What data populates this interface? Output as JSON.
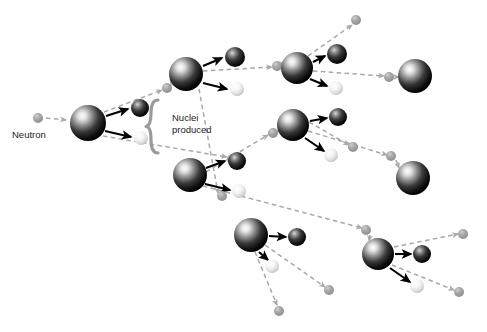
{
  "diagram": {
    "background_color": "#ffffff",
    "labels": {
      "neutron": "Neutron",
      "nuclei_produced_line1": "Nuclei",
      "nuclei_produced_line2": "produced"
    },
    "colors": {
      "neutron": "#9e9e9e",
      "neutron_arrow": "#a8a8a8",
      "nucleus_dark": "#1a1a1a",
      "nucleus_highlight": "#ffffff",
      "fragment_dark": "#1f1f1f",
      "fragment_light": "#e8e8e8",
      "fission_arrow": "#000000",
      "brace": "#9a9a9a",
      "text": "#1b1b1b"
    },
    "legend": {
      "neutron_radius": 5,
      "nucleus_radius": 17,
      "fragment_dark_radius": 9,
      "fragment_light_radius": 7
    },
    "counts": {
      "generations": 4,
      "fissioning_nuclei": 7,
      "terminal_nuclei": 2,
      "neutrons": 15
    }
  },
  "chart_data": {
    "type": "diagram",
    "neutrons": [
      {
        "id": "n0",
        "x": 38,
        "y": 118,
        "r": 5
      },
      {
        "id": "n1",
        "x": 167,
        "y": 88,
        "r": 5
      },
      {
        "id": "n2",
        "x": 232,
        "y": 159,
        "r": 5
      },
      {
        "id": "n3",
        "x": 277,
        "y": 66,
        "r": 5
      },
      {
        "id": "n4",
        "x": 356,
        "y": 20,
        "r": 5
      },
      {
        "id": "n5",
        "x": 273,
        "y": 133,
        "r": 5
      },
      {
        "id": "n6",
        "x": 389,
        "y": 77,
        "r": 5
      },
      {
        "id": "n7",
        "x": 222,
        "y": 196,
        "r": 5
      },
      {
        "id": "n8",
        "x": 353,
        "y": 147,
        "r": 5
      },
      {
        "id": "n9",
        "x": 391,
        "y": 156,
        "r": 5
      },
      {
        "id": "n10",
        "x": 366,
        "y": 230,
        "r": 5
      },
      {
        "id": "n11",
        "x": 329,
        "y": 290,
        "r": 5
      },
      {
        "id": "n12",
        "x": 279,
        "y": 311,
        "r": 5
      },
      {
        "id": "n13",
        "x": 463,
        "y": 234,
        "r": 5
      },
      {
        "id": "n14",
        "x": 459,
        "y": 292,
        "r": 5
      }
    ],
    "nuclei": [
      {
        "id": "u0",
        "x": 88,
        "y": 123,
        "r": 18,
        "fissioned": true,
        "generation": 1
      },
      {
        "id": "u1",
        "x": 186,
        "y": 74,
        "r": 17,
        "fissioned": true,
        "generation": 2
      },
      {
        "id": "u2",
        "x": 190,
        "y": 175,
        "r": 17,
        "fissioned": true,
        "generation": 2
      },
      {
        "id": "u3",
        "x": 297,
        "y": 68,
        "r": 16,
        "fissioned": true,
        "generation": 3
      },
      {
        "id": "u4",
        "x": 293,
        "y": 125,
        "r": 16,
        "fissioned": true,
        "generation": 3
      },
      {
        "id": "u5",
        "x": 251,
        "y": 235,
        "r": 17,
        "fissioned": true,
        "generation": 3
      },
      {
        "id": "u6",
        "x": 378,
        "y": 254,
        "r": 16,
        "fissioned": true,
        "generation": 4
      },
      {
        "id": "t0",
        "x": 415,
        "y": 76,
        "r": 17,
        "fissioned": false,
        "generation": 4
      },
      {
        "id": "t1",
        "x": 413,
        "y": 178,
        "r": 17,
        "fissioned": false,
        "generation": 4
      }
    ],
    "fragments": [
      {
        "parent": "u0",
        "x": 140,
        "y": 108,
        "r": 9,
        "kind": "dark"
      },
      {
        "parent": "u0",
        "x": 141,
        "y": 138,
        "r": 7,
        "kind": "light"
      },
      {
        "parent": "u1",
        "x": 235,
        "y": 57,
        "r": 10,
        "kind": "dark"
      },
      {
        "parent": "u1",
        "x": 237,
        "y": 89,
        "r": 7,
        "kind": "light"
      },
      {
        "parent": "u2",
        "x": 237,
        "y": 161,
        "r": 9,
        "kind": "dark"
      },
      {
        "parent": "u2",
        "x": 239,
        "y": 191,
        "r": 7,
        "kind": "light"
      },
      {
        "parent": "u3",
        "x": 337,
        "y": 54,
        "r": 10,
        "kind": "dark"
      },
      {
        "parent": "u3",
        "x": 336,
        "y": 88,
        "r": 7,
        "kind": "light"
      },
      {
        "parent": "u4",
        "x": 338,
        "y": 117,
        "r": 9,
        "kind": "dark"
      },
      {
        "parent": "u4",
        "x": 331,
        "y": 155,
        "r": 7,
        "kind": "light"
      },
      {
        "parent": "u5",
        "x": 297,
        "y": 237,
        "r": 9,
        "kind": "dark"
      },
      {
        "parent": "u5",
        "x": 272,
        "y": 266,
        "r": 7,
        "kind": "light"
      },
      {
        "parent": "u6",
        "x": 422,
        "y": 254,
        "r": 9,
        "kind": "dark"
      },
      {
        "parent": "u6",
        "x": 417,
        "y": 286,
        "r": 7,
        "kind": "light"
      }
    ],
    "neutron_paths": [
      {
        "from": "n0",
        "to": "u0",
        "x1": 46,
        "y1": 118,
        "x2": 66,
        "y2": 120
      },
      {
        "from": "u0",
        "to": "n1",
        "x1": 104,
        "y1": 112,
        "x2": 162,
        "y2": 90
      },
      {
        "from": "n1",
        "to": "u1",
        "x1": 174,
        "y1": 86,
        "x2": 170,
        "y2": 80
      },
      {
        "from": "u0",
        "to": "n2",
        "x1": 103,
        "y1": 136,
        "x2": 227,
        "y2": 157
      },
      {
        "from": "u1",
        "to": "n3",
        "x1": 203,
        "y1": 71,
        "x2": 272,
        "y2": 67
      },
      {
        "from": "n3",
        "to": "u3",
        "x1": 283,
        "y1": 66,
        "x2": 283,
        "y2": 67
      },
      {
        "from": "u1",
        "to": "n7",
        "x1": 199,
        "y1": 89,
        "x2": 218,
        "y2": 193
      },
      {
        "from": "u3",
        "to": "n4",
        "x1": 308,
        "y1": 56,
        "x2": 352,
        "y2": 25
      },
      {
        "from": "u3",
        "to": "n6",
        "x1": 313,
        "y1": 71,
        "x2": 384,
        "y2": 76
      },
      {
        "from": "n6",
        "to": "t0",
        "x1": 395,
        "y1": 77,
        "x2": 399,
        "y2": 77
      },
      {
        "from": "u2",
        "to": "n5",
        "x1": 206,
        "y1": 172,
        "x2": 268,
        "y2": 135
      },
      {
        "from": "n5",
        "to": "u4",
        "x1": 279,
        "y1": 132,
        "x2": 279,
        "y2": 128
      },
      {
        "from": "u2",
        "to": "n10",
        "x1": 203,
        "y1": 186,
        "x2": 362,
        "y2": 228
      },
      {
        "from": "u4",
        "to": "n8",
        "x1": 309,
        "y1": 122,
        "x2": 349,
        "y2": 145
      },
      {
        "from": "u4",
        "to": "n9",
        "x1": 308,
        "y1": 131,
        "x2": 387,
        "y2": 155
      },
      {
        "from": "n9",
        "to": "t1",
        "x1": 396,
        "y1": 160,
        "x2": 399,
        "y2": 168
      },
      {
        "from": "u5",
        "to": "n11",
        "x1": 265,
        "y1": 245,
        "x2": 325,
        "y2": 287
      },
      {
        "from": "u5",
        "to": "n12",
        "x1": 255,
        "y1": 252,
        "x2": 277,
        "y2": 305
      },
      {
        "from": "n10",
        "to": "u6",
        "x1": 370,
        "y1": 235,
        "x2": 369,
        "y2": 241
      },
      {
        "from": "u6",
        "to": "n13",
        "x1": 394,
        "y1": 247,
        "x2": 458,
        "y2": 234
      },
      {
        "from": "u6",
        "to": "n14",
        "x1": 392,
        "y1": 265,
        "x2": 454,
        "y2": 290
      }
    ],
    "fission_arrows": [
      {
        "x1": 106,
        "y1": 116,
        "x2": 128,
        "y2": 109
      },
      {
        "x1": 105,
        "y1": 131,
        "x2": 131,
        "y2": 137
      },
      {
        "x1": 203,
        "y1": 66,
        "x2": 222,
        "y2": 58
      },
      {
        "x1": 203,
        "y1": 83,
        "x2": 227,
        "y2": 89
      },
      {
        "x1": 206,
        "y1": 168,
        "x2": 225,
        "y2": 161
      },
      {
        "x1": 205,
        "y1": 184,
        "x2": 230,
        "y2": 190
      },
      {
        "x1": 313,
        "y1": 62,
        "x2": 325,
        "y2": 56
      },
      {
        "x1": 310,
        "y1": 79,
        "x2": 327,
        "y2": 86
      },
      {
        "x1": 310,
        "y1": 121,
        "x2": 327,
        "y2": 118
      },
      {
        "x1": 305,
        "y1": 138,
        "x2": 324,
        "y2": 151
      },
      {
        "x1": 269,
        "y1": 236,
        "x2": 286,
        "y2": 237
      },
      {
        "x1": 259,
        "y1": 252,
        "x2": 268,
        "y2": 260
      },
      {
        "x1": 395,
        "y1": 254,
        "x2": 411,
        "y2": 254
      },
      {
        "x1": 390,
        "y1": 268,
        "x2": 410,
        "y2": 282
      }
    ],
    "brace": {
      "x": 158,
      "y_top": 100,
      "y_bottom": 153
    },
    "text_positions": {
      "neutron": {
        "x": 12,
        "y": 138
      },
      "nuclei_line1": {
        "x": 172,
        "y": 121
      },
      "nuclei_line2": {
        "x": 172,
        "y": 133
      }
    }
  }
}
